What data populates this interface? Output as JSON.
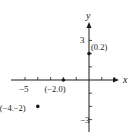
{
  "chart_data": {
    "type": "scatter",
    "title": "",
    "xlabel": "x",
    "ylabel": "y",
    "xlim": [
      -6.5,
      2.5
    ],
    "ylim": [
      -4,
      4.5
    ],
    "grid": false,
    "x_ticks": [
      -5,
      -4,
      -3,
      -2,
      -1,
      1,
      2
    ],
    "y_ticks": [
      -3,
      -2,
      -1,
      1,
      2,
      3
    ],
    "x_tick_labels": [
      {
        "value": -5,
        "label": "−5"
      }
    ],
    "y_tick_labels": [
      {
        "value": 3,
        "label": "3"
      },
      {
        "value": -3,
        "label": "−3"
      }
    ],
    "points": [
      {
        "x": 0,
        "y": 2,
        "label": "(0.2)"
      },
      {
        "x": -2,
        "y": 0,
        "label": "(−2.0)"
      },
      {
        "x": -4,
        "y": -2,
        "label": "(−4.−2)"
      }
    ],
    "colors": {
      "ink": "#1a1a1a",
      "background": "#ffffff"
    }
  }
}
